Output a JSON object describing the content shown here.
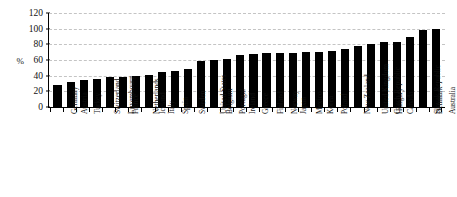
{
  "chart_data": {
    "type": "bar",
    "title": "",
    "subtitle": "",
    "xlabel": "",
    "ylabel": "%",
    "ylim": [
      0,
      120
    ],
    "ytick_step": 20,
    "yticks": [
      0,
      20,
      40,
      60,
      80,
      100,
      120
    ],
    "grid": true,
    "grid_style": "dashed",
    "legend": null,
    "legend_position": "none",
    "orientation": "vertical",
    "bar_color": "#000000",
    "background_color": "#FFFFFF",
    "sorted": "ascending",
    "categories": [
      "Germany",
      "Austria",
      "Turkey",
      "Switzerland",
      "Luxembourg",
      "France",
      "Netherlands",
      "Iceland",
      "Italy",
      "Spain",
      "Sweden",
      "United States",
      "Belgium",
      "Portugal",
      "Ireland",
      "Greece",
      "Finland",
      "Norway",
      "Japan",
      "Mexico",
      "Korea",
      "Poland",
      "New Zealand",
      "United Kingdom",
      "Czech Republic",
      "Hungary",
      "Canada",
      "Slovak Republic",
      "Denmark",
      "Australia"
    ],
    "values": [
      28,
      32,
      35,
      36,
      38,
      38.5,
      39.5,
      41.5,
      44.5,
      46.5,
      48,
      58.5,
      60.5,
      61.5,
      67,
      68,
      68.5,
      68.5,
      68.5,
      70,
      70.5,
      72,
      73.5,
      78.5,
      80.5,
      83,
      83,
      90,
      98,
      99
    ]
  }
}
